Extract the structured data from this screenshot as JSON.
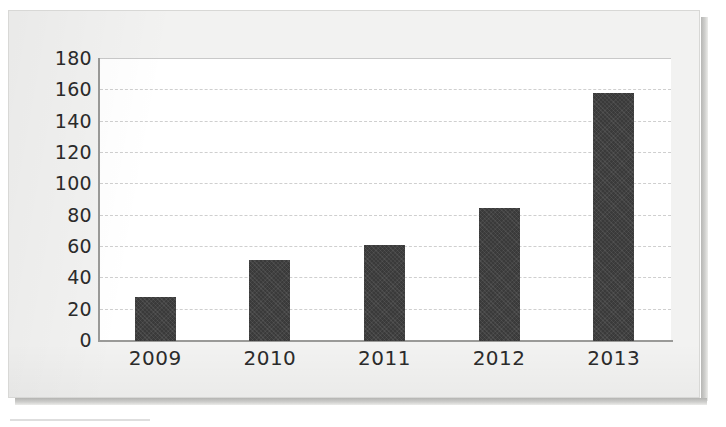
{
  "figure": {
    "background_color": "#f2f2f1",
    "plot_background_color": "#ffffff",
    "bar_color": "#3a3a3a",
    "gridline_color": "#cfcfcf",
    "axis_color": "#9a9a98",
    "text_color": "#2b2b2b"
  },
  "chart_data": {
    "type": "bar",
    "title": "",
    "subtitle": "",
    "xlabel": "",
    "ylabel": "",
    "categories": [
      "2009",
      "2010",
      "2011",
      "2012",
      "2013"
    ],
    "values": [
      28,
      52,
      61,
      85,
      158
    ],
    "series": [
      {
        "name": "",
        "values": [
          28,
          52,
          61,
          85,
          158
        ]
      }
    ],
    "ylim": [
      0,
      180
    ],
    "yticks": [
      0,
      20,
      40,
      60,
      80,
      100,
      120,
      140,
      160,
      180
    ],
    "ytick_labels": [
      "0",
      "20",
      "40",
      "60",
      "80",
      "100",
      "120",
      "140",
      "160",
      "180"
    ],
    "xtick_labels": [
      "2009",
      "2010",
      "2011",
      "2012",
      "2013"
    ],
    "grid": true,
    "grid_axis": "y",
    "legend": false,
    "legend_position": "none",
    "data_labels": false,
    "annotations": []
  }
}
